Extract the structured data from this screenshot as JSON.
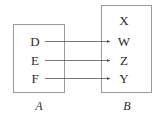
{
  "diagram": {
    "background_color": "#ffffff",
    "box_border_color": "#9a9a9a",
    "arrow_color": "#555555",
    "text_color": "#2b2b2b",
    "sets": [
      {
        "id": "A",
        "name": "A",
        "elements": [
          {
            "key": "d",
            "label": "D"
          },
          {
            "key": "e",
            "label": "E"
          },
          {
            "key": "f",
            "label": "F"
          }
        ]
      },
      {
        "id": "B",
        "name": "B",
        "elements": [
          {
            "key": "x",
            "label": "X"
          },
          {
            "key": "w",
            "label": "W"
          },
          {
            "key": "z",
            "label": "Z"
          },
          {
            "key": "y",
            "label": "Y"
          }
        ]
      }
    ],
    "mappings": [
      {
        "from": "D",
        "to": "W"
      },
      {
        "from": "E",
        "to": "Z"
      },
      {
        "from": "F",
        "to": "Y"
      }
    ]
  }
}
